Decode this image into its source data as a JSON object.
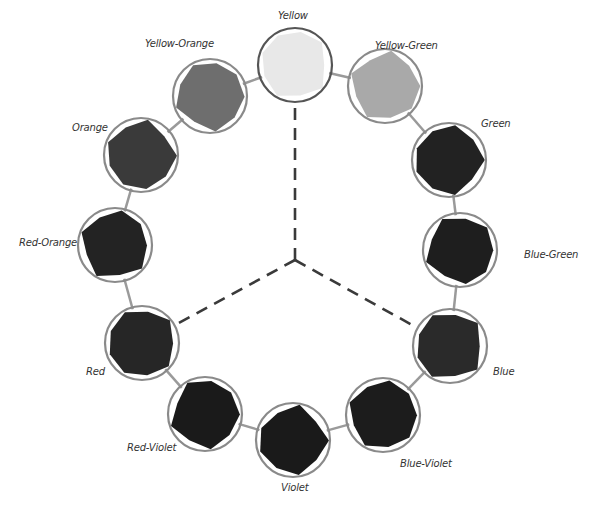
{
  "diagram": {
    "type": "color-wheel",
    "center": [
      295,
      260
    ],
    "swatches": [
      {
        "name": "Yellow",
        "cx": 295,
        "cy": 65,
        "fill": "#e8e8e8",
        "label_x": 278,
        "label_y": 10
      },
      {
        "name": "Yellow-Green",
        "cx": 385,
        "cy": 86,
        "fill": "#a9a9a9",
        "label_x": 375,
        "label_y": 40
      },
      {
        "name": "Green",
        "cx": 449,
        "cy": 160,
        "fill": "#222222",
        "label_x": 481,
        "label_y": 118
      },
      {
        "name": "Blue-Green",
        "cx": 460,
        "cy": 250,
        "fill": "#1e1e1e",
        "label_x": 524,
        "label_y": 249
      },
      {
        "name": "Blue",
        "cx": 450,
        "cy": 346,
        "fill": "#2a2a2a",
        "label_x": 493,
        "label_y": 366
      },
      {
        "name": "Blue-Violet",
        "cx": 383,
        "cy": 415,
        "fill": "#1c1c1c",
        "label_x": 400,
        "label_y": 458
      },
      {
        "name": "Violet",
        "cx": 293,
        "cy": 440,
        "fill": "#1a1a1a",
        "label_x": 281,
        "label_y": 482
      },
      {
        "name": "Red-Violet",
        "cx": 205,
        "cy": 414,
        "fill": "#1a1a1a",
        "label_x": 127,
        "label_y": 442
      },
      {
        "name": "Red",
        "cx": 142,
        "cy": 343,
        "fill": "#262626",
        "label_x": 86,
        "label_y": 366
      },
      {
        "name": "Red-Orange",
        "cx": 115,
        "cy": 245,
        "fill": "#232323",
        "label_x": 19,
        "label_y": 237
      },
      {
        "name": "Orange",
        "cx": 141,
        "cy": 155,
        "fill": "#3a3a3a",
        "label_x": 72,
        "label_y": 122
      },
      {
        "name": "Yellow-Orange",
        "cx": 210,
        "cy": 96,
        "fill": "#6e6e6e",
        "label_x": 145,
        "label_y": 38
      }
    ],
    "radius": 37,
    "dashed_lines_to": [
      "Yellow",
      "Red",
      "Blue"
    ],
    "colors": {
      "ring": "#8a8a8a",
      "connector": "#9a9a9a",
      "dash": "#3a3a3a",
      "label": "#333333"
    }
  }
}
